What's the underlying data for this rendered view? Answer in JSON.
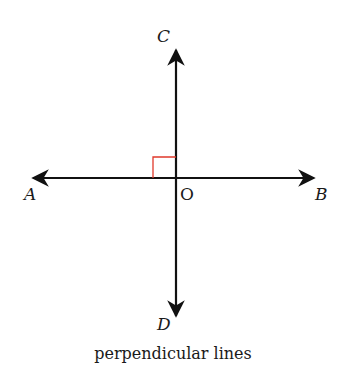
{
  "diagram": {
    "caption": "perpendicular lines",
    "points": {
      "A": "A",
      "B": "B",
      "C": "C",
      "D": "D",
      "O": "O"
    },
    "colors": {
      "line": "#111111",
      "right_angle_marker": "#e0392b"
    }
  }
}
